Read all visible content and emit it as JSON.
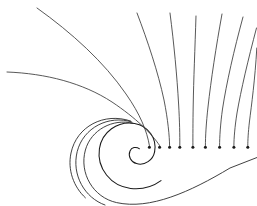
{
  "figure": {
    "background_color": "#ffffff",
    "stroke_color": "#3a3a3a",
    "core_stroke_color": "#1a1a1a",
    "dot_color": "#1a1a1a",
    "width": 257,
    "height": 206
  },
  "chart_data": {
    "type": "line",
    "subtitle": "",
    "xlabel": "",
    "ylabel": "",
    "xlim": [
      0,
      257
    ],
    "ylim": [
      0,
      206
    ],
    "grid": false,
    "legend": "none",
    "annotations": [],
    "tick_labels": {
      "x": [],
      "y": []
    },
    "spiral_center": [
      137,
      148
    ],
    "series": [
      {
        "name": "spiral-core-inner",
        "role": "spiral",
        "path": "M 139.5 148.8 C 136.0 146.2 131.5 147.5 130.0 151.0 C 127.8 156.2 131.0 162.0 136.5 163.6 C 144.8 166.0 153.0 160.0 154.6 151.8"
      },
      {
        "name": "spiral-turn-1",
        "role": "spiral",
        "path": "M 154.6 151.8 C 157.2 138.6 148.2 125.6 134.6 123.4 C 117.6 120.6 101.8 132.0 99.4 148.8 C 96.6 168.2 110.8 186.2 130.6 188.4 C 142.0 189.7 152.8 186.6 161.0 180.6"
      },
      {
        "name": "spiral-turn-2",
        "role": "spiral",
        "path": "M 133.0 123.2 C 112.8 118.2 91.0 129.8 85.4 150.0 C 79.0 173.0 93.0 197.4 116.6 202.6 C 150.0 210.0 190.0 192.0 230.0 168.0 L 257.0 157.5"
      },
      {
        "name": "spiral-turn-3",
        "role": "spiral",
        "path": "M 131.8 122.0 C 108.8 114.6 83.2 127.6 77.2 151.6 C 71.4 175.0 84.8 198.0 105.0 205.0"
      },
      {
        "name": "spiral-turn-4",
        "role": "spiral",
        "path": "M 130.6 121.0 C 104.0 112.0 76.6 126.4 71.0 153.0 C 67.4 169.8 73.6 187.0 85.4 197.8"
      },
      {
        "name": "streamline-upper-left-steep",
        "role": "streamline",
        "path": "M 37.0 8.0 C 72.0 33.0 104.0 62.0 126.0 94.0 C 140.0 114.0 147.0 131.0 149.4 145.5"
      },
      {
        "name": "streamline-upper-left-flat",
        "role": "streamline",
        "path": "M 7.0 72.0 C 46.0 73.5 83.0 83.0 112.0 102.0 C 136.0 118.0 152.0 134.0 159.6 145.5"
      },
      {
        "name": "streamline-fan-1",
        "role": "streamline",
        "path": "M 137.0 13.0 C 148.0 42.0 158.0 72.0 164.0 100.0 C 168.0 120.0 169.4 136.0 169.6 145.5"
      },
      {
        "name": "streamline-fan-2",
        "role": "streamline",
        "path": "M 170.0 13.0 C 174.0 44.0 177.0 76.0 178.6 104.0 C 179.6 121.0 179.9 136.0 179.8 145.5"
      },
      {
        "name": "streamline-fan-3",
        "role": "streamline",
        "path": "M 196.0 16.0 C 195.0 48.0 193.6 80.0 193.2 106.0 C 192.9 122.0 192.9 136.5 192.9 145.5"
      },
      {
        "name": "streamline-fan-4",
        "role": "streamline",
        "path": "M 222.0 14.0 C 216.0 47.0 211.0 80.0 208.0 107.0 C 206.2 123.0 205.4 137.0 205.4 145.5"
      },
      {
        "name": "streamline-fan-5",
        "role": "streamline",
        "path": "M 243.0 17.0 C 234.0 50.0 226.5 83.0 222.5 109.0 C 220.4 124.0 219.6 137.5 219.6 145.5"
      },
      {
        "name": "streamline-fan-6",
        "role": "streamline",
        "path": "M 256.5 28.0 C 248.0 60.0 241.0 90.0 237.0 113.0 C 234.8 127.0 233.9 138.5 233.9 145.5"
      },
      {
        "name": "streamline-fan-7",
        "role": "streamline",
        "path": "M 256.8 48.0 C 255.0 80.0 251.5 105.0 249.4 122.0 C 248.2 132.5 247.8 140.5 247.8 145.5"
      }
    ],
    "endpoints": [
      {
        "name": "endpoint-1",
        "x": 149.4,
        "y": 147.3,
        "r": 1.5
      },
      {
        "name": "endpoint-2",
        "x": 159.6,
        "y": 147.3,
        "r": 1.5
      },
      {
        "name": "endpoint-3",
        "x": 169.6,
        "y": 147.3,
        "r": 1.5
      },
      {
        "name": "endpoint-4",
        "x": 179.8,
        "y": 147.3,
        "r": 1.5
      },
      {
        "name": "endpoint-5",
        "x": 192.9,
        "y": 147.3,
        "r": 1.5
      },
      {
        "name": "endpoint-6",
        "x": 205.4,
        "y": 147.3,
        "r": 1.5
      },
      {
        "name": "endpoint-7",
        "x": 219.6,
        "y": 147.3,
        "r": 1.5
      },
      {
        "name": "endpoint-8",
        "x": 233.9,
        "y": 147.3,
        "r": 1.5
      },
      {
        "name": "endpoint-9",
        "x": 247.8,
        "y": 147.3,
        "r": 1.5
      }
    ]
  }
}
